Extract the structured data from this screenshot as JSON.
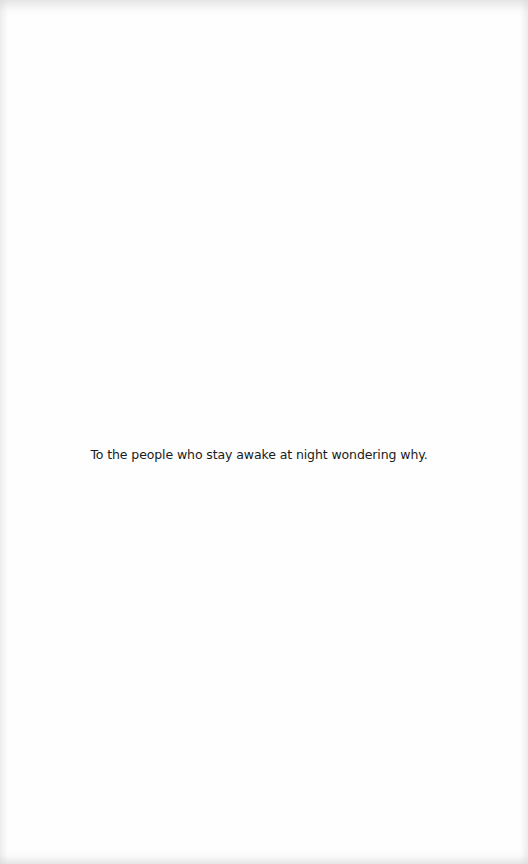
{
  "page": {
    "background_color": "#fefefe",
    "text_color": "#1a1a1a"
  },
  "dedication": {
    "text": "To the people who stay awake at night wondering why."
  }
}
